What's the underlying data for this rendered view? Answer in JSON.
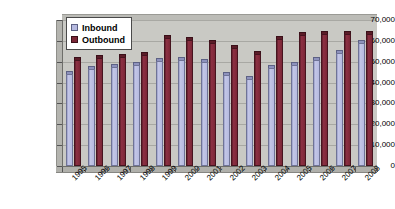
{
  "chart_data": {
    "type": "bar",
    "title": "",
    "xlabel": "",
    "ylabel": "",
    "ylim": [
      0,
      70000
    ],
    "ytick_labels": [
      "70,000",
      "60,000",
      "50,000",
      "40,000",
      "30,000",
      "20,000",
      "10,000",
      "0"
    ],
    "ytick_values": [
      70000,
      60000,
      50000,
      40000,
      30000,
      20000,
      10000,
      0
    ],
    "grid": true,
    "legend_position": "top-left",
    "categories": [
      "1995",
      "1996",
      "1997",
      "1998",
      "1999",
      "2000",
      "2001",
      "2002",
      "2003",
      "2004",
      "2005",
      "2006",
      "2007",
      "2008"
    ],
    "series": [
      {
        "name": "Inbound",
        "color": "#b6bae0",
        "values": [
          44000,
          46500,
          47500,
          48500,
          50500,
          51000,
          50000,
          43500,
          41500,
          47000,
          48500,
          51000,
          54000,
          59000
        ]
      },
      {
        "name": "Outbound",
        "color": "#7a2636",
        "values": [
          51000,
          52000,
          52500,
          53000,
          61500,
          60500,
          59000,
          56500,
          53500,
          61000,
          63000,
          63500,
          63500,
          63500
        ]
      }
    ]
  },
  "legend": {
    "items": [
      {
        "label": "Inbound",
        "swatch": "inbound-swatch-icon"
      },
      {
        "label": "Outbound",
        "swatch": "outbound-swatch-icon"
      }
    ]
  }
}
